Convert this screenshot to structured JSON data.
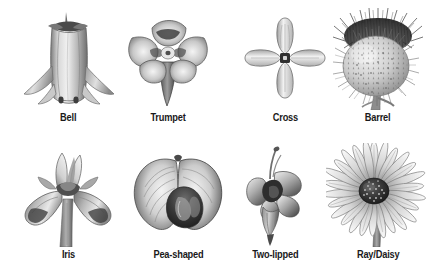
{
  "figure": {
    "background_color": "#ffffff",
    "label_color": "#1a1a1a",
    "rows": 2,
    "columns": 4,
    "style": "grayscale botanical illustrations"
  },
  "items": [
    {
      "label": "Bell",
      "icon": "bell-flower-illustration",
      "row": 1,
      "column": 1,
      "description": "Elongated tubular bell with flared recurved petal tips"
    },
    {
      "label": "Trumpet",
      "icon": "trumpet-flower-illustration",
      "row": 1,
      "column": 2,
      "description": "Five spreading face-on lobes above a narrow tapering tube"
    },
    {
      "label": "Cross",
      "icon": "cross-flower-illustration",
      "row": 1,
      "column": 3,
      "description": "Four petals set at right angles around a dark center"
    },
    {
      "label": "Barrel",
      "icon": "barrel-flower-illustration",
      "row": 1,
      "column": 4,
      "description": "Spiny globular thistle head with bristly crown"
    },
    {
      "label": "Iris",
      "icon": "iris-flower-illustration",
      "row": 2,
      "column": 1,
      "description": "Upright standards with drooping falls on a stem"
    },
    {
      "label": "Pea-shaped",
      "icon": "pea-shaped-flower-illustration",
      "row": 2,
      "column": 2,
      "description": "Broad banner petals with darker folded keel"
    },
    {
      "label": "Two-lipped",
      "icon": "two-lipped-flower-illustration",
      "row": 2,
      "column": 3,
      "description": "Upper and lower lip lobes with protruding stamen"
    },
    {
      "label": "Ray/Daisy",
      "icon": "ray-daisy-flower-illustration",
      "row": 2,
      "column": 4,
      "description": "Many narrow ray petals around a dark speckled disc"
    }
  ]
}
